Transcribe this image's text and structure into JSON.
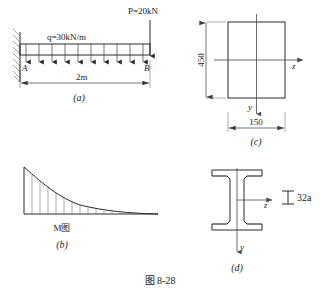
{
  "figure": {
    "caption": "图 8-28",
    "panels": [
      {
        "id": "a",
        "label": "(a)",
        "title": "cantilever-beam-loading"
      },
      {
        "id": "b",
        "label": "(b)",
        "title": "bending-moment-diagram"
      },
      {
        "id": "c",
        "label": "(c)",
        "title": "rectangular-cross-section"
      },
      {
        "id": "d",
        "label": "(d)",
        "title": "i-beam-cross-section"
      }
    ]
  },
  "panel_a": {
    "distributed_load_label": "q=30kN/m",
    "point_load_label": "P=20kN",
    "node_left_label": "A",
    "node_right_label": "B",
    "span_label": "2m",
    "arrow_count": 10
  },
  "panel_b": {
    "diagram_label": "M图"
  },
  "panel_c": {
    "height_label": "450",
    "width_label": "150",
    "axis_z_label": "z",
    "axis_y_label": "y"
  },
  "panel_d": {
    "section_label": "32a",
    "axis_z_label": "z",
    "axis_y_label": "y"
  },
  "colors": {
    "ink": "#2a2a2a",
    "light_ink": "#4a4a4a",
    "hatch": "#555555",
    "background": "#ffffff"
  }
}
